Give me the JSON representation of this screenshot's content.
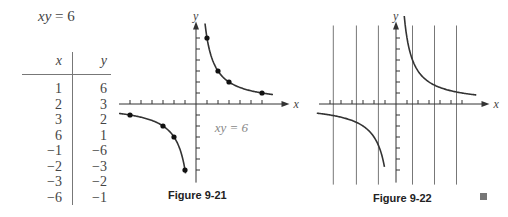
{
  "equation_label": {
    "lhs": "xy",
    "rhs": "= 6"
  },
  "table": {
    "headers": [
      "x",
      "y"
    ],
    "rows": [
      [
        "1",
        "6"
      ],
      [
        "2",
        "3"
      ],
      [
        "3",
        "2"
      ],
      [
        "6",
        "1"
      ],
      [
        "−1",
        "−6"
      ],
      [
        "−2",
        "−3"
      ],
      [
        "−3",
        "−2"
      ],
      [
        "−6",
        "−1"
      ]
    ]
  },
  "chart_data": [
    {
      "type": "scatter",
      "title": "Figure 9-21",
      "xlabel": "x",
      "ylabel": "y",
      "annotation": "xy = 6",
      "function": "y = 6/x",
      "xlim": [
        -7,
        8.5
      ],
      "ylim": [
        -6.6,
        7.5
      ],
      "x_ticks": [
        -6,
        -5,
        -4,
        -3,
        -2,
        -1,
        1,
        2,
        3,
        4,
        5,
        6
      ],
      "y_ticks": [
        -6,
        -5,
        -4,
        -3,
        -2,
        -1,
        1,
        2,
        3,
        4,
        5,
        6
      ],
      "points": [
        {
          "x": 1,
          "y": 6
        },
        {
          "x": 2,
          "y": 3
        },
        {
          "x": 3,
          "y": 2
        },
        {
          "x": 6,
          "y": 1
        },
        {
          "x": -1,
          "y": -6
        },
        {
          "x": -2,
          "y": -3
        },
        {
          "x": -3,
          "y": -2
        },
        {
          "x": -6,
          "y": -1
        }
      ],
      "curve_domain": [
        [
          0.82,
          7.0
        ],
        [
          -7.0,
          -0.95
        ]
      ],
      "grid": false
    },
    {
      "type": "line",
      "title": "Figure 9-22",
      "xlabel": "x",
      "ylabel": "y",
      "function": "y = 6/x",
      "xlim": [
        -7,
        8.5
      ],
      "ylim": [
        -6.6,
        7.5
      ],
      "x_ticks": [
        -6,
        -5,
        -4,
        -3,
        -2,
        -1,
        1,
        2,
        3,
        4,
        5,
        6
      ],
      "y_ticks": [
        -6,
        -5,
        -4,
        -3,
        -2,
        -1,
        1,
        2,
        3,
        4,
        5,
        6
      ],
      "vertical_lines": [
        -5.7,
        -3.6,
        -1.6,
        1.5,
        3.5,
        5.5
      ],
      "curve_domain": [
        [
          0.75,
          7.3
        ],
        [
          -7.2,
          -1.05
        ]
      ],
      "grid": false
    }
  ]
}
